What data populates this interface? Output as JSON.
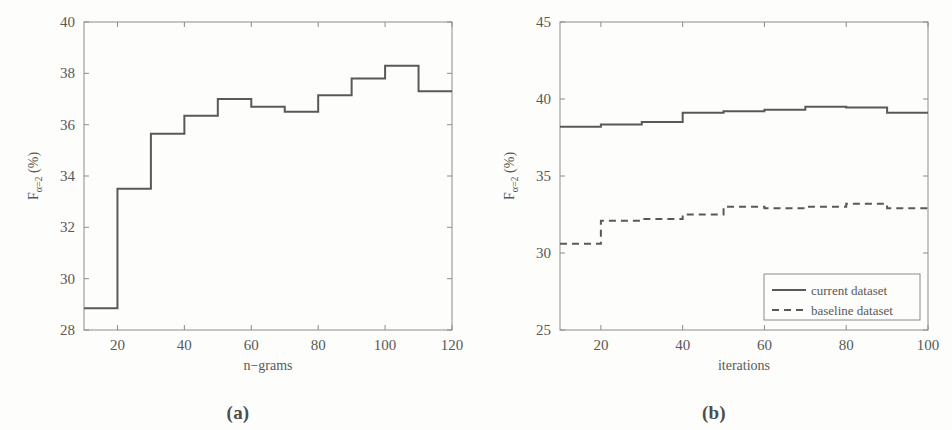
{
  "figure": {
    "background_color": "#fdfdfb",
    "line_color": "#595959",
    "axis_color": "#8c8c8c"
  },
  "panels": [
    {
      "id": "a",
      "caption": "(a)",
      "chart_data": {
        "type": "line",
        "drawstyle": "steps-post",
        "title": "",
        "xlabel": "n−grams",
        "ylabel": "Fα=2 (%)",
        "ylabel_parts": {
          "base": "F",
          "sub": "α=2",
          "unit": "(%)"
        },
        "xlim": [
          10,
          120
        ],
        "ylim": [
          28,
          40
        ],
        "xticks": [
          20,
          40,
          60,
          80,
          100,
          120
        ],
        "yticks": [
          28,
          30,
          32,
          34,
          36,
          38,
          40
        ],
        "xticklabels": [
          "20",
          "40",
          "60",
          "80",
          "100",
          "120"
        ],
        "yticklabels": [
          "28",
          "30",
          "32",
          "34",
          "36",
          "38",
          "40"
        ],
        "grid": false,
        "legend": null,
        "series": [
          {
            "name": "current dataset",
            "style": "solid",
            "x": [
              10,
              20,
              30,
              40,
              50,
              60,
              70,
              80,
              90,
              100,
              110,
              120
            ],
            "values": [
              28.85,
              33.5,
              35.65,
              36.35,
              37.0,
              36.7,
              36.5,
              37.15,
              37.8,
              38.3,
              37.3,
              37.3
            ]
          }
        ]
      }
    },
    {
      "id": "b",
      "caption": "(b)",
      "chart_data": {
        "type": "line",
        "drawstyle": "steps-post",
        "title": "",
        "xlabel": "iterations",
        "ylabel": "Fα=2 (%)",
        "ylabel_parts": {
          "base": "F",
          "sub": "α=2",
          "unit": "(%)"
        },
        "xlim": [
          10,
          100
        ],
        "ylim": [
          25,
          45
        ],
        "xticks": [
          20,
          40,
          60,
          80,
          100
        ],
        "yticks": [
          25,
          30,
          35,
          40,
          45
        ],
        "xticklabels": [
          "20",
          "40",
          "60",
          "80",
          "100"
        ],
        "yticklabels": [
          "25",
          "30",
          "35",
          "40",
          "45"
        ],
        "grid": false,
        "legend": {
          "position": "lower right",
          "entries": [
            "current dataset",
            "baseline dataset"
          ]
        },
        "series": [
          {
            "name": "current dataset",
            "style": "solid",
            "x": [
              10,
              20,
              30,
              40,
              50,
              60,
              70,
              80,
              90,
              100
            ],
            "values": [
              38.2,
              38.35,
              38.5,
              39.1,
              39.2,
              39.3,
              39.5,
              39.45,
              39.1,
              39.1
            ]
          },
          {
            "name": "baseline dataset",
            "style": "dashed",
            "x": [
              10,
              20,
              30,
              40,
              50,
              60,
              70,
              80,
              90,
              100
            ],
            "values": [
              30.6,
              32.1,
              32.2,
              32.5,
              33.0,
              32.9,
              33.0,
              33.2,
              32.9,
              32.9
            ]
          }
        ]
      }
    }
  ]
}
